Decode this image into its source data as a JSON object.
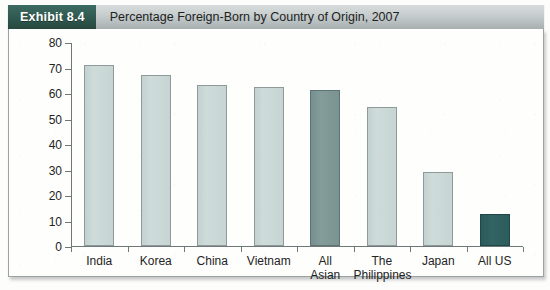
{
  "header": {
    "badge_label": "Exhibit 8.4",
    "title": "Percentage Foreign-Born by Country of Origin, 2007"
  },
  "colors": {
    "badge_bg": "#2f584f",
    "header_bg": "#c6cccd",
    "bar_light": "#c8d6d4",
    "bar_medium": "#7d9a9a",
    "bar_dark": "#2e5d5d",
    "axis": "#6f7878",
    "text": "#1e2424"
  },
  "chart_data": {
    "type": "bar",
    "title": "Percentage Foreign-Born by Country of Origin, 2007",
    "xlabel": "",
    "ylabel": "",
    "ylim": [
      0,
      80
    ],
    "yticks": [
      0,
      10,
      20,
      30,
      40,
      50,
      60,
      70,
      80
    ],
    "grid": false,
    "legend": "none",
    "categories": [
      "India",
      "Korea",
      "China",
      "Vietnam",
      "All Asian",
      "The Philippines",
      "Japan",
      "All US"
    ],
    "category_lines": [
      [
        "India",
        ""
      ],
      [
        "Korea",
        ""
      ],
      [
        "China",
        ""
      ],
      [
        "Vietnam",
        ""
      ],
      [
        "All",
        "Asian"
      ],
      [
        "The",
        "Philippines"
      ],
      [
        "Japan",
        ""
      ],
      [
        "All US",
        ""
      ]
    ],
    "values": [
      71,
      67,
      63,
      62.5,
      61,
      54.5,
      29,
      12.5
    ],
    "bar_styles": [
      "light",
      "light",
      "light",
      "light",
      "medium",
      "light",
      "light",
      "dark"
    ]
  }
}
